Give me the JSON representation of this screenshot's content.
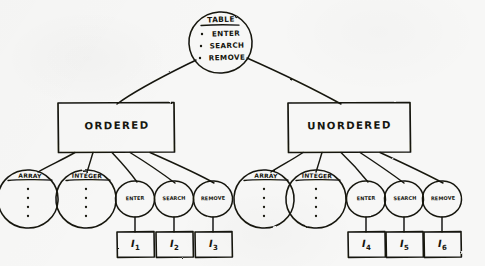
{
  "diagram": {
    "ink_color": "#16160f",
    "paper_color": "#f7f7f6"
  },
  "root": {
    "name": "table-node",
    "shape": "circle",
    "title": "TABLE",
    "operations": [
      "ENTER",
      "SEARCH",
      "REMOVE"
    ],
    "bullet": "•"
  },
  "branches": [
    {
      "name": "ordered-branch",
      "shape": "rectangle",
      "label": "ORDERED",
      "children": [
        {
          "name": "array-node",
          "shape": "circle",
          "label": "ARRAY",
          "body": "vertical-ellipsis"
        },
        {
          "name": "integer-node",
          "shape": "circle",
          "label": "INTEGER",
          "body": "vertical-ellipsis"
        },
        {
          "name": "enter-node",
          "shape": "circle",
          "label": "ENTER",
          "instance": "I",
          "index": "1"
        },
        {
          "name": "search-node",
          "shape": "circle",
          "label": "SEARCH",
          "instance": "I",
          "index": "2"
        },
        {
          "name": "remove-node",
          "shape": "circle",
          "label": "REMOVE",
          "instance": "I",
          "index": "3"
        }
      ]
    },
    {
      "name": "unordered-branch",
      "shape": "rectangle",
      "label": "UNORDERED",
      "children": [
        {
          "name": "array-node",
          "shape": "circle",
          "label": "ARRAY",
          "body": "vertical-ellipsis"
        },
        {
          "name": "integer-node",
          "shape": "circle",
          "label": "INTEGER",
          "body": "vertical-ellipsis"
        },
        {
          "name": "enter-node",
          "shape": "circle",
          "label": "ENTER",
          "instance": "I",
          "index": "4"
        },
        {
          "name": "search-node",
          "shape": "circle",
          "label": "SEARCH",
          "instance": "I",
          "index": "5"
        },
        {
          "name": "remove-node",
          "shape": "circle",
          "label": "REMOVE",
          "instance": "I",
          "index": "6"
        }
      ]
    }
  ],
  "instances": [
    {
      "name": "instance-box-1",
      "label": "I",
      "index": "1"
    },
    {
      "name": "instance-box-2",
      "label": "I",
      "index": "2"
    },
    {
      "name": "instance-box-3",
      "label": "I",
      "index": "3"
    },
    {
      "name": "instance-box-4",
      "label": "I",
      "index": "4"
    },
    {
      "name": "instance-box-5",
      "label": "I",
      "index": "5"
    },
    {
      "name": "instance-box-6",
      "label": "I",
      "index": "6"
    }
  ],
  "ellipsis_dot": "•"
}
